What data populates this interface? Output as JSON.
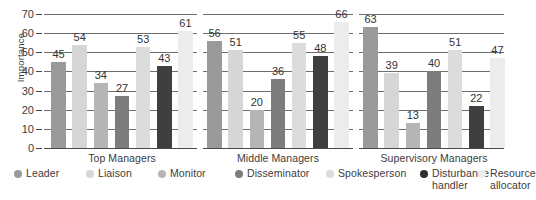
{
  "chart_data": {
    "type": "bar",
    "title": "",
    "subtitle": "",
    "xlabel": "",
    "ylabel": "Importance",
    "ylim": [
      0,
      70
    ],
    "ytick_step": 10,
    "yticks": [
      0,
      10,
      20,
      30,
      40,
      50,
      60,
      70
    ],
    "grid": true,
    "grid_axis": "y",
    "legend_position": "bottom",
    "show_data_labels": true,
    "categories": [
      "Top Managers",
      "Middle Managers",
      "Supervisory Managers"
    ],
    "series": [
      {
        "name": "Leader",
        "color": "#9a9a9a",
        "values": [
          45,
          56,
          63
        ]
      },
      {
        "name": "Liaison",
        "color": "#d6d6d6",
        "values": [
          54,
          51,
          39
        ]
      },
      {
        "name": "Monitor",
        "color": "#b5b5b5",
        "values": [
          34,
          20,
          13
        ]
      },
      {
        "name": "Disseminator",
        "color": "#7d7d7d",
        "values": [
          27,
          36,
          40
        ]
      },
      {
        "name": "Spokesperson",
        "color": "#dcdcdc",
        "values": [
          53,
          55,
          51
        ]
      },
      {
        "name": "Disturbance\nhandler",
        "color": "#3f3f3f",
        "values": [
          43,
          48,
          22
        ]
      },
      {
        "name": "Resource\nallocator",
        "color": "#ececec",
        "values": [
          61,
          66,
          47
        ]
      }
    ]
  },
  "legend": {
    "items": [
      {
        "label": "Leader",
        "dot_color": "#9a9a9a"
      },
      {
        "label": "Liaison",
        "dot_color": "#d6d6d6"
      },
      {
        "label": "Monitor",
        "dot_color": "#b5b5b5"
      },
      {
        "label": "Disseminator",
        "dot_color": "#7d7d7d"
      },
      {
        "label": "Spokesperson",
        "dot_color": "#dcdcdc"
      },
      {
        "label": "Disturbance\nhandler",
        "dot_color": "#2e2e2e"
      },
      {
        "label": "Resource\nallocator",
        "dot_color": "#ececec"
      }
    ]
  }
}
